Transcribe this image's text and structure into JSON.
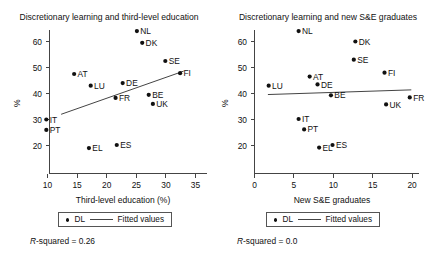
{
  "figure": {
    "width": 437,
    "height": 256,
    "background": "#ffffff",
    "ink_color": "#111111"
  },
  "chart_data": [
    {
      "type": "scatter",
      "panel": "left",
      "title": "Discretionary learning and third-level education",
      "xlabel": "Third-level education (%)",
      "ylabel": "%",
      "xlim": [
        8.3,
        36.2
      ],
      "ylim": [
        17.5,
        65.5
      ],
      "xticks": [
        10,
        15,
        20,
        25,
        30,
        35
      ],
      "xtick_labels": [
        "10",
        "15",
        "20",
        "25",
        "30",
        "35"
      ],
      "yticks": [
        20,
        30,
        40,
        50,
        60
      ],
      "ytick_labels": [
        "20",
        "30",
        "40",
        "50",
        "60"
      ],
      "grid": false,
      "series_name": "DL",
      "points": [
        {
          "label": "NL",
          "x": 25.1,
          "y": 64.0
        },
        {
          "label": "DK",
          "x": 26.0,
          "y": 59.5
        },
        {
          "label": "SE",
          "x": 29.9,
          "y": 52.5
        },
        {
          "label": "FI",
          "x": 32.4,
          "y": 47.8
        },
        {
          "label": "AT",
          "x": 14.5,
          "y": 47.5
        },
        {
          "label": "LU",
          "x": 17.3,
          "y": 43.0
        },
        {
          "label": "DE",
          "x": 22.7,
          "y": 44.0
        },
        {
          "label": "FR",
          "x": 21.5,
          "y": 38.3
        },
        {
          "label": "BE",
          "x": 27.1,
          "y": 39.5
        },
        {
          "label": "UK",
          "x": 27.8,
          "y": 36.0
        },
        {
          "label": "IT",
          "x": 9.8,
          "y": 30.0
        },
        {
          "label": "PT",
          "x": 9.8,
          "y": 26.0
        },
        {
          "label": "EL",
          "x": 17.0,
          "y": 19.0
        },
        {
          "label": "ES",
          "x": 21.7,
          "y": 20.2
        }
      ],
      "fit": {
        "label": "Fitted values",
        "x1": 12.3,
        "y1": 32.0,
        "x2": 33.0,
        "y2": 48.6
      },
      "rsquared_prefix": "R",
      "rsquared_text": "-squared = 0.26",
      "legend": {
        "marker_label": "DL",
        "line_label": "Fitted values",
        "position": "below-axis"
      }
    },
    {
      "type": "scatter",
      "panel": "right",
      "title": "Discretionary learning and new S&E graduates",
      "xlabel": "New S&E graduates",
      "ylabel": "%",
      "xlim": [
        -1.1,
        21.5
      ],
      "ylim": [
        17.5,
        65.5
      ],
      "xticks": [
        0,
        5,
        10,
        15,
        20
      ],
      "xtick_labels": [
        "0",
        "5",
        "10",
        "15",
        "20"
      ],
      "yticks": [
        20,
        30,
        40,
        50,
        60
      ],
      "ytick_labels": [
        "20",
        "30",
        "40",
        "50",
        "60"
      ],
      "grid": false,
      "series_name": "DL",
      "points": [
        {
          "label": "NL",
          "x": 5.6,
          "y": 64.0
        },
        {
          "label": "DK",
          "x": 12.8,
          "y": 60.0
        },
        {
          "label": "SE",
          "x": 12.6,
          "y": 53.0
        },
        {
          "label": "FI",
          "x": 16.5,
          "y": 48.0
        },
        {
          "label": "AT",
          "x": 7.0,
          "y": 46.5
        },
        {
          "label": "DE",
          "x": 8.0,
          "y": 43.5
        },
        {
          "label": "LU",
          "x": 1.8,
          "y": 43.0
        },
        {
          "label": "BE",
          "x": 9.7,
          "y": 39.3
        },
        {
          "label": "FR",
          "x": 19.7,
          "y": 38.5
        },
        {
          "label": "UK",
          "x": 16.7,
          "y": 35.8
        },
        {
          "label": "IT",
          "x": 5.6,
          "y": 30.2
        },
        {
          "label": "PT",
          "x": 6.3,
          "y": 26.2
        },
        {
          "label": "EL",
          "x": 8.2,
          "y": 19.2
        },
        {
          "label": "ES",
          "x": 9.9,
          "y": 20.2
        }
      ],
      "fit": {
        "label": "Fitted values",
        "x1": 1.7,
        "y1": 39.6,
        "x2": 19.9,
        "y2": 41.4
      },
      "rsquared_prefix": "R",
      "rsquared_text": "-squared = 0.0",
      "legend": {
        "marker_label": "DL",
        "line_label": "Fitted values",
        "position": "below-axis"
      }
    }
  ]
}
